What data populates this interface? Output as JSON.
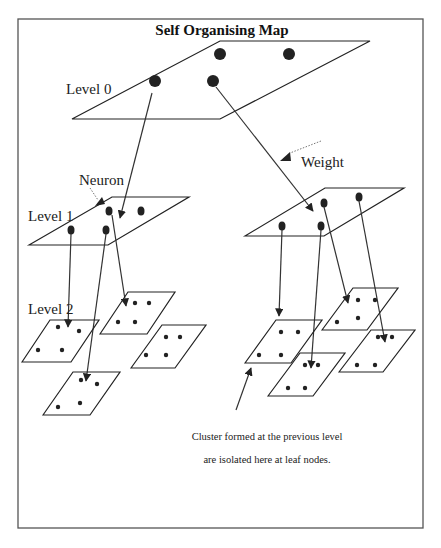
{
  "diagram": {
    "title": "Self Organising Map",
    "labels": {
      "level0": "Level 0",
      "level1": "Level 1",
      "level2": "Level 2",
      "neuron": "Neuron",
      "weight": "Weight"
    },
    "caption": {
      "line1": "Cluster formed at the previous level",
      "line2": "are isolated here at leaf nodes."
    },
    "colors": {
      "ink": "#222222",
      "frame": "#555555",
      "background": "#ffffff"
    },
    "levels": [
      {
        "name": "Level 0",
        "maps": 1,
        "neurons_per_map": 4
      },
      {
        "name": "Level 1",
        "maps": 2,
        "neurons_per_map": 4
      },
      {
        "name": "Level 2",
        "maps": 6,
        "neurons_per_map": 4
      }
    ]
  }
}
